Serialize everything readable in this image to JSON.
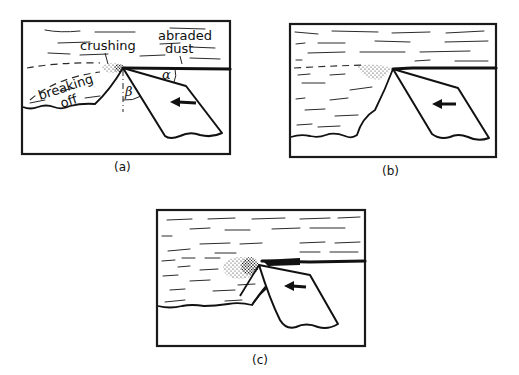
{
  "figure": {
    "panels": [
      {
        "id": "a",
        "caption": "(a)",
        "labels": {
          "crushing": "crushing",
          "abraded_dust": [
            "abraded",
            "dust"
          ],
          "breaking_off": [
            "breaking",
            "off"
          ],
          "alpha": "α",
          "beta": "β"
        },
        "direction_arrow": "left"
      },
      {
        "id": "b",
        "caption": "(b)",
        "direction_arrow": "left"
      },
      {
        "id": "c",
        "caption": "(c)",
        "direction_arrow": "left"
      }
    ]
  },
  "colors": {
    "ink": "#111111",
    "background": "#ffffff"
  }
}
